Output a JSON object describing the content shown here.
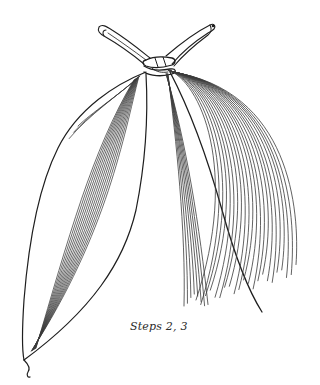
{
  "figure": {
    "caption": "Steps 2, 3",
    "ink_color": "#1e1e1e",
    "vein_color": "#3a3a3a",
    "background": "#ffffff"
  },
  "left_leaf": {
    "vein_count": 16,
    "tip": [
      24,
      362
    ]
  },
  "right_fan": {
    "vein_count": 22
  },
  "knot": {
    "center": [
      164,
      62
    ]
  }
}
